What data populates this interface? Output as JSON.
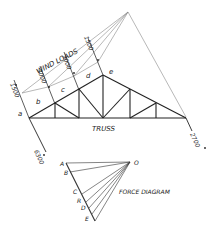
{
  "labels": {
    "wind_loads": "WIND LOADS",
    "truss": "TRUSS",
    "force_diagram": "FORCE DIAGRAM"
  },
  "truss": {
    "space_labels": [
      "a",
      "b",
      "c",
      "d",
      "e"
    ],
    "wind_loads": [
      "1500",
      "3000",
      "3000",
      "1500"
    ],
    "reactions": {
      "left": "6300",
      "right": "2700"
    }
  },
  "force_diagram": {
    "pole": "O",
    "points": [
      "A",
      "B",
      "C",
      "R",
      "D",
      "E"
    ]
  },
  "colors": {
    "line": "#222222",
    "construction_line": "#777777",
    "background": "#ffffff"
  }
}
